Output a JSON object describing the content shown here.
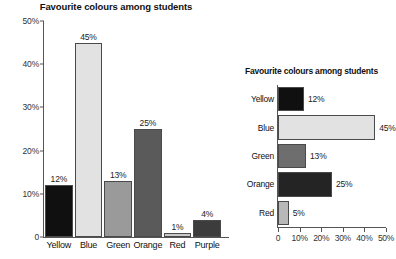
{
  "chart_data": [
    {
      "id": "vertical",
      "type": "bar",
      "orientation": "vertical",
      "title": "Favourite colours among students",
      "categories": [
        "Yellow",
        "Blue",
        "Green",
        "Orange",
        "Red",
        "Purple"
      ],
      "values": [
        12,
        45,
        13,
        25,
        1,
        4
      ],
      "value_labels": [
        "12%",
        "45%",
        "13%",
        "25%",
        "1%",
        "4%"
      ],
      "bar_colors": [
        "#101010",
        "#e2e2e2",
        "#9a9a9a",
        "#5a5a5a",
        "#c9c9c9",
        "#3c3c3c"
      ],
      "xlabel": "",
      "ylabel": "",
      "ylim": [
        0,
        50
      ],
      "ytick_labels": [
        "0",
        "10%",
        "20%",
        "30%",
        "40%",
        "50%"
      ],
      "ytick_values": [
        0,
        10,
        20,
        30,
        40,
        50
      ],
      "grid": false,
      "legend": false
    },
    {
      "id": "horizontal",
      "type": "bar",
      "orientation": "horizontal",
      "title": "Favourite colours among students",
      "categories": [
        "Yellow",
        "Blue",
        "Green",
        "Orange",
        "Red"
      ],
      "values": [
        12,
        45,
        13,
        25,
        5
      ],
      "value_labels": [
        "12%",
        "45%",
        "13%",
        "25%",
        "5%"
      ],
      "bar_colors": [
        "#101010",
        "#e2e2e2",
        "#6e6e6e",
        "#242424",
        "#b8b8b8"
      ],
      "xlabel": "",
      "ylabel": "",
      "xlim": [
        0,
        50
      ],
      "xtick_labels": [
        "0",
        "10%",
        "20%",
        "30%",
        "40%",
        "50%"
      ],
      "xtick_values": [
        0,
        10,
        20,
        30,
        40,
        50
      ],
      "grid": false,
      "legend": false
    }
  ]
}
